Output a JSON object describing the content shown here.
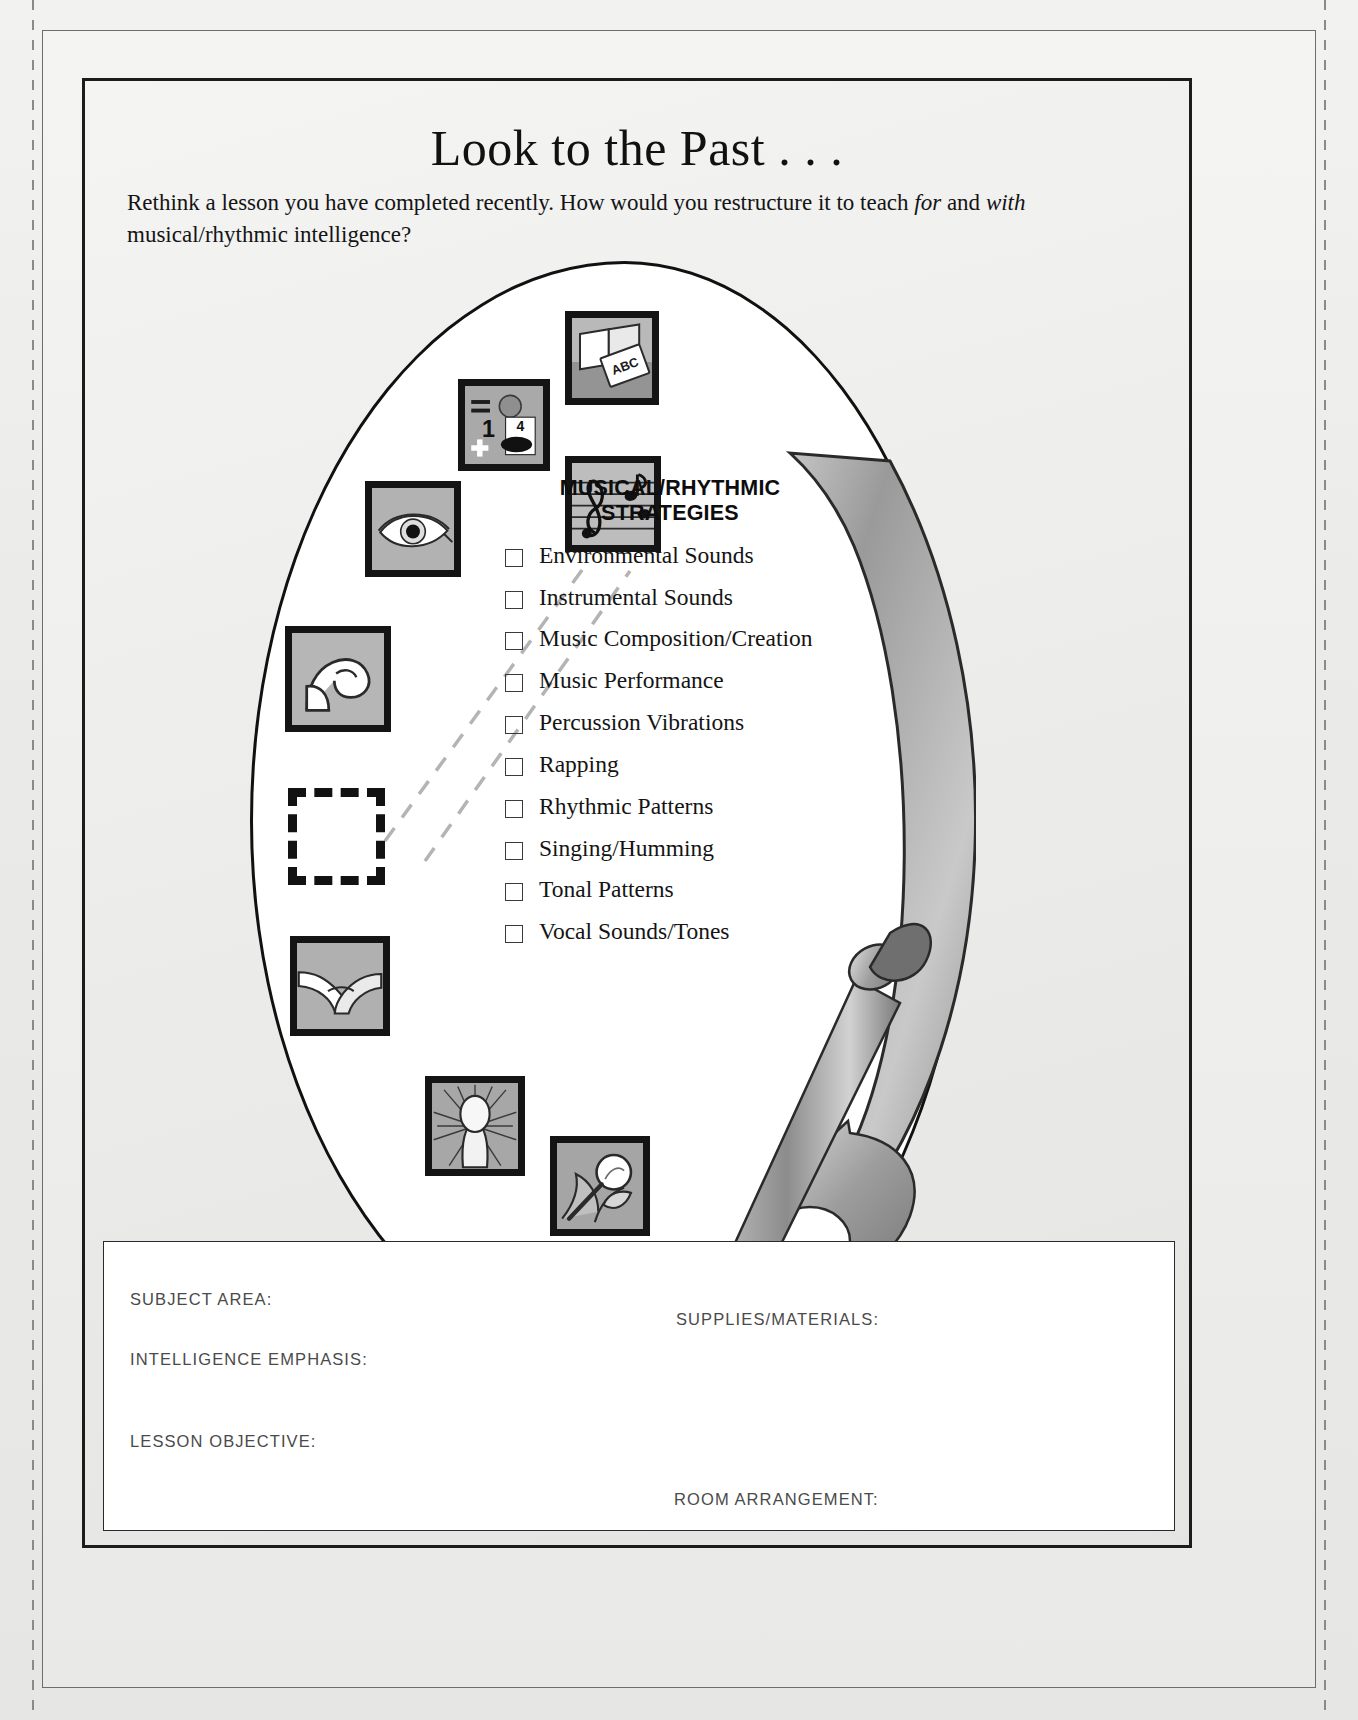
{
  "header": {
    "title": "Look to the Past . . .",
    "instructions_part1": "Rethink a lesson you have completed recently. How would you restructure it to teach ",
    "instructions_em1": "for",
    "instructions_part2": " and ",
    "instructions_em2": "with",
    "instructions_part3": " musical/rhythmic intelligence?"
  },
  "strategies": {
    "heading_line1": "MUSICAL/RHYTHMIC",
    "heading_line2": "STRATEGIES",
    "items": [
      {
        "label": "Environmental Sounds",
        "checked": false
      },
      {
        "label": "Instrumental Sounds",
        "checked": false
      },
      {
        "label": "Music Composition/Creation",
        "checked": false
      },
      {
        "label": "Music Performance",
        "checked": false
      },
      {
        "label": "Percussion Vibrations",
        "checked": false
      },
      {
        "label": "Rapping",
        "checked": false
      },
      {
        "label": "Rhythmic Patterns",
        "checked": false
      },
      {
        "label": "Singing/Humming",
        "checked": false
      },
      {
        "label": "Tonal Patterns",
        "checked": false
      },
      {
        "label": "Vocal Sounds/Tones",
        "checked": false
      }
    ]
  },
  "icon_tiles": [
    {
      "name": "book-abc-tile",
      "alt": "open book with ABC primer"
    },
    {
      "name": "logical-math-tile",
      "alt": "equals sign, circle, numeral 1, card with numeral 4, plus sign"
    },
    {
      "name": "music-staff-tile",
      "alt": "treble clef staff with notes"
    },
    {
      "name": "eye-tile",
      "alt": "human eye"
    },
    {
      "name": "flexed-arm-tile",
      "alt": "flexed bicep arm"
    },
    {
      "name": "handshake-tile",
      "alt": "two hands clasped"
    },
    {
      "name": "head-radiant-tile",
      "alt": "head silhouette with radiating lines"
    },
    {
      "name": "nature-magnifier-tile",
      "alt": "leaf and flower with magnifying glass"
    },
    {
      "name": "empty-dashed-slot",
      "alt": "empty dashed placeholder square"
    }
  ],
  "tile_text": {
    "abc": "ABC",
    "numeral_one": "1",
    "numeral_four": "4",
    "plus": "+",
    "equals": "="
  },
  "form": {
    "subject_area": "SUBJECT AREA:",
    "intelligence_emphasis": "INTELLIGENCE  EMPHASIS:",
    "lesson_objective": "LESSON OBJECTIVE:",
    "supplies_materials": "SUPPLIES/MATERIALS:",
    "room_arrangement": "ROOM ARRANGEMENT:"
  },
  "colors": {
    "paper": "#eeeeed",
    "ink": "#141414",
    "tile_border": "#141414",
    "tile_fill": "#b4b4b4",
    "form_label": "#4a4a4a",
    "leader_line": "#b0b0b0"
  }
}
